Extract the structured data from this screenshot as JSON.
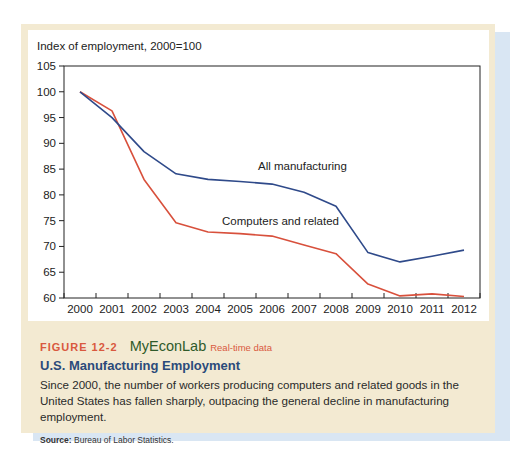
{
  "figure": {
    "number": "FIGURE 12-2",
    "brand": "MyEconLab",
    "brand_tag": "Real-time data",
    "title": "U.S. Manufacturing Employment",
    "description": "Since 2000, the number of workers producing computers and related goods in the United States has fallen sharply, outpacing the general decline in manufacturing employment.",
    "source_label": "Source:",
    "source_text": " Bureau of Labor Statistics."
  },
  "colors": {
    "all_manufacturing": "#2f4a8a",
    "computers_related": "#d8503c",
    "frame": "#f3ead2",
    "shadow": "#d9e6f3",
    "figure_number": "#d9593e",
    "brand": "#2f5a2a",
    "title": "#2b4a7a"
  },
  "chart_data": {
    "type": "line",
    "title": "",
    "ylabel": "Index of employment, 2000=100",
    "xlabel": "",
    "x": [
      "2000",
      "2001",
      "2002",
      "2003",
      "2004",
      "2005",
      "2006",
      "2007",
      "2008",
      "2009",
      "2010",
      "2011",
      "2012"
    ],
    "ylim": [
      60,
      105
    ],
    "yticks": [
      60,
      65,
      70,
      75,
      80,
      85,
      90,
      95,
      100,
      105
    ],
    "grid": false,
    "legend": "inline labels",
    "series": [
      {
        "name": "All manufacturing",
        "color": "#2f4a8a",
        "values": [
          100,
          95.0,
          88.4,
          84.1,
          83.0,
          82.6,
          82.1,
          80.5,
          77.8,
          68.8,
          67.0,
          68.1,
          69.3
        ]
      },
      {
        "name": "Computers and related",
        "color": "#d8503c",
        "values": [
          100,
          96.3,
          83.0,
          74.6,
          72.8,
          72.5,
          72.0,
          70.3,
          68.6,
          62.7,
          60.4,
          60.8,
          60.3
        ]
      }
    ]
  }
}
